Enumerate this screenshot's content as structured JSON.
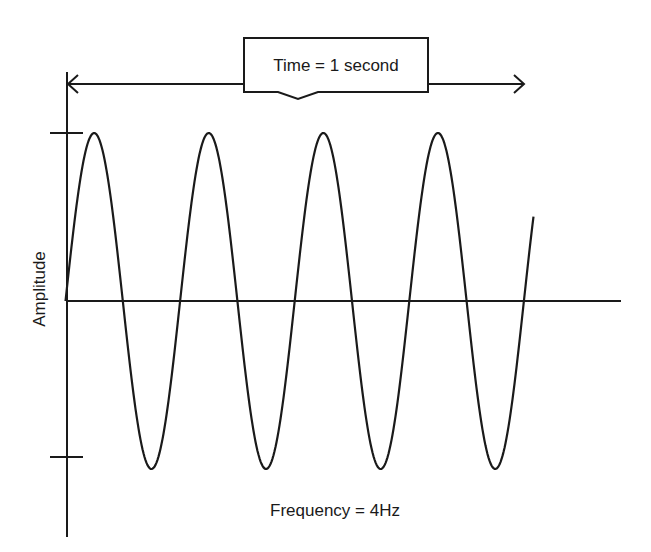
{
  "diagram": {
    "type": "waveform",
    "callout_label": "Time = 1 second",
    "y_axis_label": "Amplitude",
    "bottom_label": "Frequency = 4Hz",
    "cycles_shown": 4,
    "colors": {
      "stroke": "#1a1a1a",
      "background": "#ffffff"
    }
  },
  "chart_data": {
    "type": "line",
    "title": "",
    "xlabel": "Time = 1 second",
    "ylabel": "Amplitude",
    "annotation": "Frequency = 4Hz",
    "series": [
      {
        "name": "sine wave",
        "frequency_hz": 4,
        "duration_s": 1,
        "peaks": 4,
        "troughs": 4
      }
    ],
    "grid": false
  }
}
